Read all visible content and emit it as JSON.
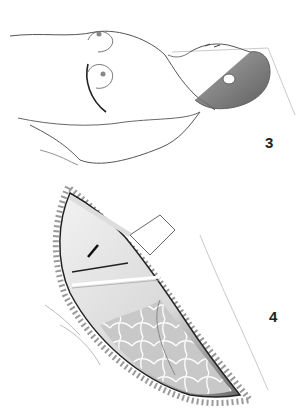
{
  "figures": [
    {
      "label": "3",
      "description": "Patient lying supine with arm abducted; curved inframammary incision line marked on chest"
    },
    {
      "label": "4",
      "description": "Open surgical wound showing chest wall with rib, small incision, and underlying lobulated lung tissue"
    }
  ],
  "colors": {
    "line": "#333333",
    "shade": "#8a8a8a",
    "background": "#ffffff"
  }
}
